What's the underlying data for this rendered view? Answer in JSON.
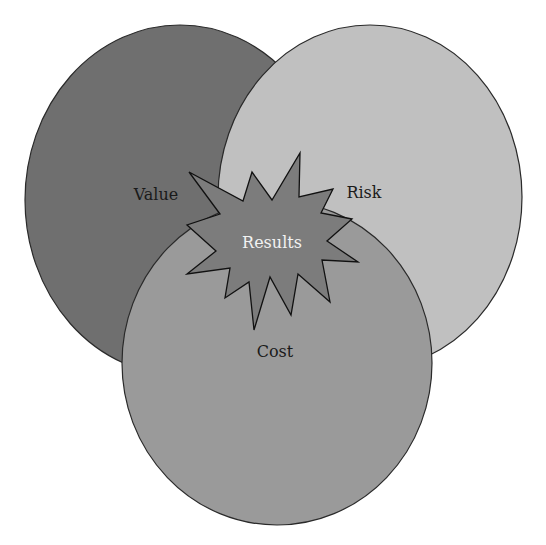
{
  "diagram": {
    "type": "venn",
    "background": "#ffffff",
    "sets": [
      {
        "id": "value",
        "label": "Value",
        "fill": "#6f6f6f",
        "stroke": "#2a2a2a",
        "cx": 180,
        "cy": 200,
        "rx": 155,
        "ry": 175,
        "label_x": 156,
        "label_y": 200,
        "label_color": "#1a1a1a"
      },
      {
        "id": "risk",
        "label": "Risk",
        "fill": "#c0c0c0",
        "stroke": "#2a2a2a",
        "cx": 370,
        "cy": 197,
        "rx": 152,
        "ry": 172,
        "label_x": 364,
        "label_y": 198,
        "label_color": "#1a1a1a"
      },
      {
        "id": "cost",
        "label": "Cost",
        "fill": "#9a9a9a",
        "stroke": "#2a2a2a",
        "cx": 277,
        "cy": 363,
        "rx": 155,
        "ry": 162,
        "label_x": 275,
        "label_y": 357,
        "label_color": "#1a1a1a"
      }
    ],
    "center": {
      "label": "Results",
      "shape": "starburst",
      "fill": "#7c7c7c",
      "stroke": "#111111",
      "label_color": "#f2f2f2",
      "label_x": 272,
      "label_y": 248,
      "points": "189,172 243,201 252,172 272,200 300,153 299,197 333,189 321,213 352,219 327,241 358,262 322,260 330,302 298,274 291,315 270,277 254,330 249,282 225,298 230,268 187,274 216,251 187,225 220,214"
    }
  }
}
